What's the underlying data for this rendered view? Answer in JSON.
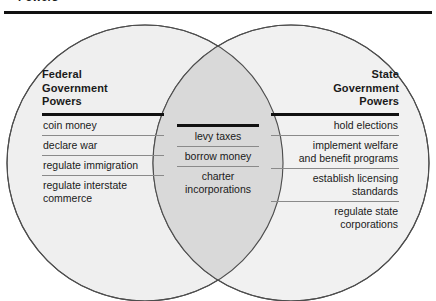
{
  "page": {
    "top_fragment_text": "Powers",
    "diagram_type": "venn-diagram",
    "colors": {
      "circle_fill": "#efefef",
      "overlap_fill": "#d9d9d9",
      "circle_stroke": "#4d4d4d",
      "rule_dark": "#111111",
      "rule_light": "#8a8a8a",
      "text": "#1a1a1a",
      "background": "#ffffff"
    }
  },
  "left_circle": {
    "heading": "Federal\nGovernment\nPowers",
    "items": [
      "coin money",
      "declare war",
      "regulate immigration",
      "regulate interstate\ncommerce"
    ]
  },
  "overlap": {
    "heading": "",
    "items": [
      "levy taxes",
      "borrow money",
      "charter\nincorporations"
    ]
  },
  "right_circle": {
    "heading": "State\nGovernment\nPowers",
    "items": [
      "hold elections",
      "implement welfare\nand benefit programs",
      "establish licensing\nstandards",
      "regulate state\ncorporations"
    ]
  }
}
